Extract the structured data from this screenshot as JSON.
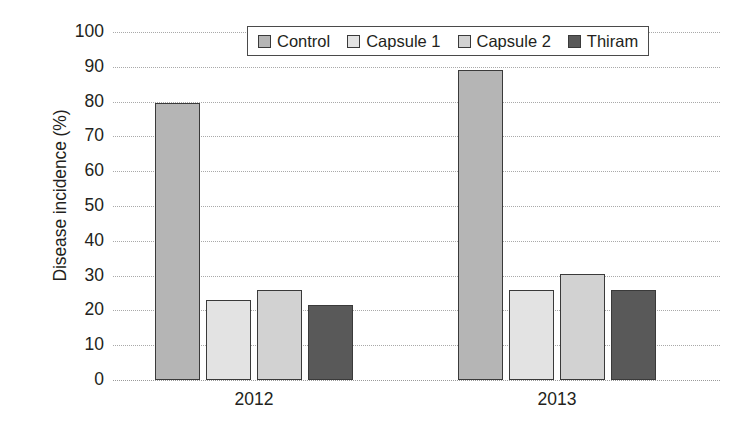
{
  "chart_data": {
    "type": "bar",
    "title": "",
    "subtitle": "",
    "xlabel": "",
    "ylabel": "Disease incidence (%)",
    "categories": [
      "2012",
      "2013"
    ],
    "series": [
      {
        "name": "Control",
        "values": [
          79.5,
          89.0
        ],
        "color": "#b5b5b5"
      },
      {
        "name": "Capsule 1",
        "values": [
          23.0,
          26.0
        ],
        "color": "#e3e3e3"
      },
      {
        "name": "Capsule 2",
        "values": [
          26.0,
          30.5
        ],
        "color": "#d2d2d2"
      },
      {
        "name": "Thiram",
        "values": [
          21.5,
          26.0
        ],
        "color": "#595959"
      }
    ],
    "ylim": [
      0,
      100
    ],
    "ytick_step": 10,
    "yticks": [
      0,
      10,
      20,
      30,
      40,
      50,
      60,
      70,
      80,
      90,
      100
    ],
    "ytick_labels": [
      "0",
      "10",
      "20",
      "30",
      "40",
      "50",
      "60",
      "70",
      "80",
      "90",
      "100"
    ],
    "grid": true,
    "grid_style": "dotted",
    "grid_axis": "y",
    "legend": true,
    "legend_position": "top-center",
    "bar_border_color": "#3a3a3a",
    "background_color": "#ffffff",
    "text_color": "#231f20",
    "annotations": []
  }
}
